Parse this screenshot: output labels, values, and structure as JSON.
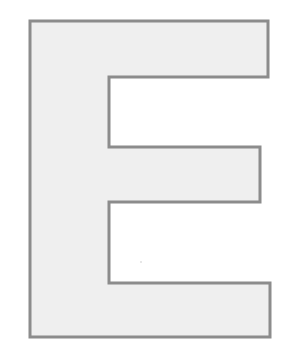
{
  "letter": {
    "character": "E",
    "fill_color": "#efefef",
    "stroke_color": "#8c8c8c",
    "stroke_width": 3,
    "points": "30,21 268,21 268,77 109,77 109,147 260,147 260,202 109,202 109,283 270,283 270,337 30,337"
  },
  "speck": {
    "x": 141,
    "y": 262,
    "color": "#c8c8c8"
  }
}
